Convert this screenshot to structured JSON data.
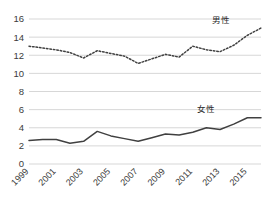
{
  "chart_data": {
    "type": "line",
    "title": "",
    "xlabel": "",
    "ylabel": "",
    "ylim": [
      0,
      16
    ],
    "ytick_values": [
      0,
      2,
      4,
      6,
      8,
      10,
      12,
      14,
      16
    ],
    "ytick_labels": [
      "0",
      "2",
      "4",
      "6",
      "8",
      "10",
      "12",
      "14",
      "16"
    ],
    "grid": true,
    "legend_position": "inline-annotation",
    "x": [
      1999,
      2000,
      2001,
      2002,
      2003,
      2004,
      2005,
      2006,
      2007,
      2008,
      2009,
      2010,
      2011,
      2012,
      2013,
      2014,
      2015,
      2016
    ],
    "xtick_values": [
      1999,
      2001,
      2003,
      2005,
      2007,
      2009,
      2011,
      2013,
      2015
    ],
    "xtick_labels": [
      "1999",
      "2001",
      "2003",
      "2005",
      "2007",
      "2009",
      "2011",
      "2013",
      "2015"
    ],
    "series": [
      {
        "name": "男性",
        "style": "dotted",
        "color": "#404040",
        "values": [
          13.0,
          12.8,
          12.6,
          12.3,
          11.7,
          12.5,
          12.2,
          11.9,
          11.1,
          11.6,
          12.1,
          11.8,
          13.0,
          12.6,
          12.4,
          13.1,
          14.2,
          15.0
        ]
      },
      {
        "name": "女性",
        "style": "solid",
        "color": "#404040",
        "values": [
          2.6,
          2.7,
          2.7,
          2.3,
          2.5,
          3.6,
          3.1,
          2.8,
          2.5,
          2.9,
          3.3,
          3.2,
          3.5,
          4.0,
          3.8,
          4.4,
          5.1,
          5.1
        ]
      }
    ],
    "annotations": [
      {
        "text": "男性",
        "x": 2013.1,
        "y": 15.6,
        "name": "male-series-label"
      },
      {
        "text": "女性",
        "x": 2012.0,
        "y": 5.75,
        "name": "female-series-label"
      }
    ]
  }
}
